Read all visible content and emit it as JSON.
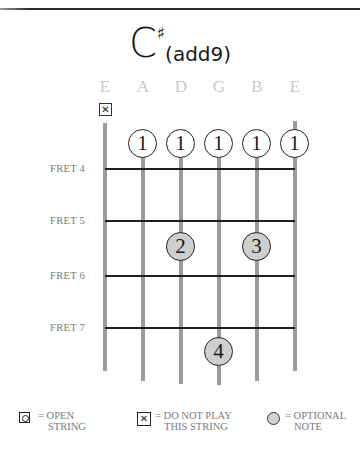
{
  "chord": {
    "root": "C",
    "accidental": "♯",
    "extension": "(add9)"
  },
  "strings": [
    {
      "name": "E",
      "x": 105,
      "top": 123,
      "bottom": 371,
      "muted": true
    },
    {
      "name": "A",
      "x": 143,
      "top": 131,
      "bottom": 381,
      "muted": false
    },
    {
      "name": "D",
      "x": 181,
      "top": 131,
      "bottom": 384,
      "muted": false
    },
    {
      "name": "G",
      "x": 219,
      "top": 131,
      "bottom": 385,
      "muted": false
    },
    {
      "name": "B",
      "x": 257,
      "top": 131,
      "bottom": 381,
      "muted": false
    },
    {
      "name": "E",
      "x": 295,
      "top": 121,
      "bottom": 371,
      "muted": false
    }
  ],
  "mute_symbol": "✕",
  "frets": [
    {
      "label": "FRET 4",
      "y": 169
    },
    {
      "label": "FRET 5",
      "y": 221
    },
    {
      "label": "FRET 6",
      "y": 276
    },
    {
      "label": "FRET 7",
      "y": 328
    }
  ],
  "fingers": [
    {
      "finger": "1",
      "string": "A",
      "x": 143,
      "y": 144,
      "type": "barre"
    },
    {
      "finger": "1",
      "string": "D",
      "x": 181,
      "y": 144,
      "type": "barre"
    },
    {
      "finger": "1",
      "string": "G",
      "x": 219,
      "y": 144,
      "type": "barre"
    },
    {
      "finger": "1",
      "string": "B",
      "x": 257,
      "y": 144,
      "type": "barre"
    },
    {
      "finger": "1",
      "string": "E",
      "x": 295,
      "y": 144,
      "type": "barre"
    },
    {
      "finger": "2",
      "string": "D",
      "fret": 5,
      "x": 181,
      "y": 247,
      "type": "fretted"
    },
    {
      "finger": "3",
      "string": "B",
      "fret": 5,
      "x": 257,
      "y": 247,
      "type": "fretted"
    },
    {
      "finger": "4",
      "string": "G",
      "fret": 7,
      "x": 219,
      "y": 352,
      "type": "fretted"
    }
  ],
  "legend": {
    "open": {
      "line1": "= OPEN",
      "line2": "STRING"
    },
    "mute": {
      "symbol": "✕",
      "line1": "= DO NOT PLAY",
      "line2": "THIS STRING"
    },
    "optional": {
      "line1": "= OPTIONAL",
      "line2": "NOTE"
    }
  },
  "colors": {
    "string": "#9b9b9b",
    "fret": "#1f1f1f",
    "label": "#c9c9c9",
    "fret_label": "#7a7a7a",
    "fretted_fill": "#cfcfcf"
  }
}
